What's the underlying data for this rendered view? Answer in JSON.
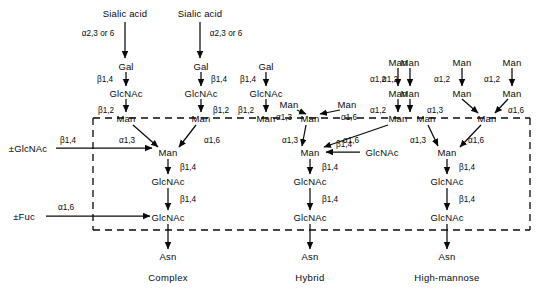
{
  "diagram": {
    "title_categories": [
      {
        "id": "complex",
        "label": "Complex",
        "x": 168,
        "y": 277
      },
      {
        "id": "hybrid",
        "label": "Hybrid",
        "x": 310,
        "y": 277
      },
      {
        "id": "high-mannose",
        "label": "High-mannose",
        "x": 447,
        "y": 277
      }
    ],
    "residues": [
      {
        "id": "sialic-acid-1",
        "label": "Sialic acid",
        "x": 125,
        "y": 13
      },
      {
        "id": "sialic-acid-2",
        "label": "Sialic acid",
        "x": 200,
        "y": 13
      },
      {
        "id": "gal-1",
        "label": "Gal",
        "x": 126,
        "y": 66
      },
      {
        "id": "gal-2",
        "label": "Gal",
        "x": 201,
        "y": 66
      },
      {
        "id": "gal-3",
        "label": "Gal",
        "x": 266,
        "y": 66
      },
      {
        "id": "glcnac-antenna-1",
        "label": "GlcNAc",
        "x": 126,
        "y": 93
      },
      {
        "id": "glcnac-antenna-2",
        "label": "GlcNAc",
        "x": 201,
        "y": 93
      },
      {
        "id": "glcnac-antenna-3",
        "label": "GlcNAc",
        "x": 266,
        "y": 93
      },
      {
        "id": "man-arm-complex-a",
        "label": "Man",
        "x": 126,
        "y": 118
      },
      {
        "id": "man-arm-complex-b",
        "label": "Man",
        "x": 201,
        "y": 118
      },
      {
        "id": "man-arm-complex-c",
        "label": "Man",
        "x": 266,
        "y": 118
      },
      {
        "id": "man-core-complex",
        "label": "Man",
        "x": 168,
        "y": 152
      },
      {
        "id": "glcnac-core1-complex",
        "label": "GlcNAc",
        "x": 168,
        "y": 181
      },
      {
        "id": "glcnac-core2-complex",
        "label": "GlcNAc",
        "x": 168,
        "y": 217
      },
      {
        "id": "asn-complex",
        "label": "Asn",
        "x": 168,
        "y": 256
      },
      {
        "id": "man-hyb-13",
        "label": "Man",
        "x": 289,
        "y": 104
      },
      {
        "id": "man-hyb-16",
        "label": "Man",
        "x": 347,
        "y": 104
      },
      {
        "id": "man-hyb-arm-left",
        "label": "Man",
        "x": 310,
        "y": 118
      },
      {
        "id": "man-hyb-top-a2",
        "label": "Man",
        "x": 398,
        "y": 62
      },
      {
        "id": "man-hyb-mid-a2",
        "label": "Man",
        "x": 398,
        "y": 93
      },
      {
        "id": "man-hyb-arm-right",
        "label": "Man",
        "x": 398,
        "y": 118
      },
      {
        "id": "man-core-hybrid",
        "label": "Man",
        "x": 310,
        "y": 152
      },
      {
        "id": "glcnac-bisecting",
        "label": "GlcNAc",
        "x": 382,
        "y": 152
      },
      {
        "id": "glcnac-core1-hybrid",
        "label": "GlcNAc",
        "x": 310,
        "y": 181
      },
      {
        "id": "glcnac-core2-hybrid",
        "label": "GlcNAc",
        "x": 310,
        "y": 217
      },
      {
        "id": "asn-hybrid",
        "label": "Asn",
        "x": 310,
        "y": 256
      },
      {
        "id": "man-hm-top-1",
        "label": "Man",
        "x": 410,
        "y": 62
      },
      {
        "id": "man-hm-top-2",
        "label": "Man",
        "x": 462,
        "y": 62
      },
      {
        "id": "man-hm-top-3",
        "label": "Man",
        "x": 512,
        "y": 62
      },
      {
        "id": "man-hm-mid-1",
        "label": "Man",
        "x": 410,
        "y": 93
      },
      {
        "id": "man-hm-mid-2",
        "label": "Man",
        "x": 462,
        "y": 93
      },
      {
        "id": "man-hm-mid-3",
        "label": "Man",
        "x": 512,
        "y": 93
      },
      {
        "id": "man-hm-arm-left",
        "label": "Man",
        "x": 426,
        "y": 118
      },
      {
        "id": "man-hm-arm-right",
        "label": "Man",
        "x": 487,
        "y": 118
      },
      {
        "id": "man-core-highmannose",
        "label": "Man",
        "x": 447,
        "y": 152
      },
      {
        "id": "glcnac-core1-hm",
        "label": "GlcNAc",
        "x": 447,
        "y": 181
      },
      {
        "id": "glcnac-core2-hm",
        "label": "GlcNAc",
        "x": 447,
        "y": 217
      },
      {
        "id": "asn-highmannose",
        "label": "Asn",
        "x": 447,
        "y": 256
      },
      {
        "id": "optional-glcnac",
        "label": "±GlcNAc",
        "x": 28,
        "y": 148
      },
      {
        "id": "optional-fuc",
        "label": "±Fuc",
        "x": 24,
        "y": 216
      }
    ],
    "linkages": [
      {
        "id": "lnk-sia-1",
        "label": "α2,3 or 6",
        "x": 98,
        "y": 33
      },
      {
        "id": "lnk-sia-2",
        "label": "α2,3 or 6",
        "x": 226,
        "y": 33
      },
      {
        "id": "lnk-gal-1",
        "label": "β1,4",
        "x": 105,
        "y": 79
      },
      {
        "id": "lnk-gal-2",
        "label": "β1,4",
        "x": 219,
        "y": 79
      },
      {
        "id": "lnk-gal-3",
        "label": "β1,4",
        "x": 248,
        "y": 79
      },
      {
        "id": "lnk-b12-1",
        "label": "β1,2",
        "x": 106,
        "y": 110
      },
      {
        "id": "lnk-b12-2",
        "label": "β1,2",
        "x": 221,
        "y": 110
      },
      {
        "id": "lnk-b12-3",
        "label": "β1,2",
        "x": 246,
        "y": 110
      },
      {
        "id": "lnk-a13-complex",
        "label": "α1,3",
        "x": 127,
        "y": 140
      },
      {
        "id": "lnk-a16-complex",
        "label": "α1,6",
        "x": 212,
        "y": 140
      },
      {
        "id": "lnk-b14-bis-complex",
        "label": "β1,4",
        "x": 68,
        "y": 140
      },
      {
        "id": "lnk-b14-core1-complex",
        "label": "β1,4",
        "x": 188,
        "y": 167
      },
      {
        "id": "lnk-b14-core2-complex",
        "label": "β1,4",
        "x": 188,
        "y": 199
      },
      {
        "id": "lnk-fuc",
        "label": "α1,6",
        "x": 66,
        "y": 207
      },
      {
        "id": "lnk-hyb-a13",
        "label": "α1,3",
        "x": 284,
        "y": 117
      },
      {
        "id": "lnk-hyb-a16",
        "label": "α1,6",
        "x": 349,
        "y": 117
      },
      {
        "id": "lnk-hyb-a12-mid",
        "label": "α1,2",
        "x": 378,
        "y": 110
      },
      {
        "id": "lnk-hyb-a12-top",
        "label": "α1,2",
        "x": 378,
        "y": 79
      },
      {
        "id": "lnk-hyb-arm-a13",
        "label": "α1,3",
        "x": 290,
        "y": 140
      },
      {
        "id": "lnk-hyb-arm-a16",
        "label": "α1,6",
        "x": 351,
        "y": 140
      },
      {
        "id": "lnk-bisect",
        "label": "β1,4",
        "x": 344,
        "y": 144
      },
      {
        "id": "lnk-b14-core1-hybrid",
        "label": "β1,4",
        "x": 330,
        "y": 167
      },
      {
        "id": "lnk-b14-core2-hybrid",
        "label": "β1,4",
        "x": 330,
        "y": 199
      },
      {
        "id": "lnk-hm-a12-1",
        "label": "α1,2",
        "x": 390,
        "y": 79
      },
      {
        "id": "lnk-hm-a12-2",
        "label": "α1,2",
        "x": 442,
        "y": 79
      },
      {
        "id": "lnk-hm-a12-3",
        "label": "α1,2",
        "x": 492,
        "y": 79
      },
      {
        "id": "lnk-hm-a13-mid",
        "label": "α1,3",
        "x": 435,
        "y": 110
      },
      {
        "id": "lnk-hm-a16-mid",
        "label": "α1,6",
        "x": 516,
        "y": 110
      },
      {
        "id": "lnk-hm-arm-a13",
        "label": "α1,3",
        "x": 418,
        "y": 140
      },
      {
        "id": "lnk-hm-arm-a16",
        "label": "α1,6",
        "x": 476,
        "y": 140
      },
      {
        "id": "lnk-b14-core1-hm",
        "label": "β1,4",
        "x": 467,
        "y": 167
      },
      {
        "id": "lnk-b14-core2-hm",
        "label": "β1,4",
        "x": 467,
        "y": 199
      }
    ],
    "colors": {
      "ink": "#0a0a0a",
      "background": "#ffffff"
    }
  }
}
